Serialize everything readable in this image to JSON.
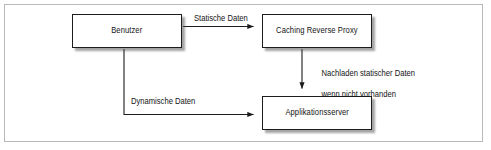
{
  "figure": {
    "language": "de",
    "background_color": "#ffffff",
    "frame_color": "#b8b8b8",
    "line_color": "#1c1c1c",
    "text_color": "#141414",
    "shadow_color": "#5a5a5a"
  },
  "nodes": [
    {
      "id": "benutzer",
      "label": "Benutzer"
    },
    {
      "id": "proxy",
      "label": "Caching Reverse Proxy"
    },
    {
      "id": "appserver",
      "label": "Applikationsserver"
    }
  ],
  "edges": [
    {
      "id": "statische-daten",
      "label": "Statische Daten",
      "from": "benutzer",
      "to": "proxy",
      "direction": "horizontal-right"
    },
    {
      "id": "nachladen",
      "label_line1": "Nachladen statischer Daten",
      "label_line2": "wenn nicht vorhanden",
      "from": "proxy",
      "to": "appserver",
      "direction": "vertical-down"
    },
    {
      "id": "dynamische-daten",
      "label": "Dynamische Daten",
      "from": "benutzer",
      "to": "appserver",
      "direction": "elbow-down-right"
    }
  ]
}
